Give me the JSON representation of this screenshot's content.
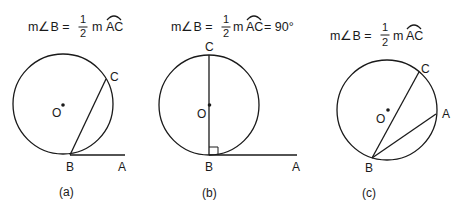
{
  "figures": [
    {
      "id": "a",
      "caption": "(a)",
      "equation": {
        "lhs": "m∠B =",
        "frac_num": "1",
        "frac_den": "2",
        "rhs": "m",
        "arc": "AC",
        "tail": ""
      },
      "points": {
        "O": "O",
        "B": "B",
        "C": "C",
        "A": "A"
      }
    },
    {
      "id": "b",
      "caption": "(b)",
      "equation": {
        "lhs": "m∠B =",
        "frac_num": "1",
        "frac_den": "2",
        "rhs": "m",
        "arc": "AC",
        "tail": "= 90°"
      },
      "points": {
        "O": "O",
        "B": "B",
        "C": "C",
        "A": "A"
      }
    },
    {
      "id": "c",
      "caption": "(c)",
      "equation": {
        "lhs": "m∠B =",
        "frac_num": "1",
        "frac_den": "2",
        "rhs": "m",
        "arc": "AC",
        "tail": ""
      },
      "points": {
        "O": "O",
        "B": "B",
        "C": "C",
        "A": "A"
      }
    }
  ],
  "colors": {
    "ink": "#1a1a1a",
    "background": "#ffffff"
  }
}
